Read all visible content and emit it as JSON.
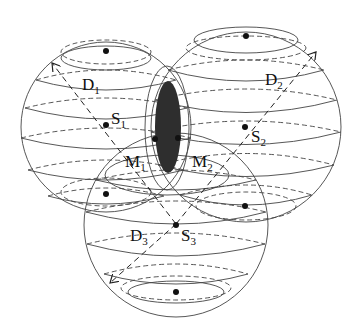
{
  "diagram": {
    "spheres": [
      {
        "id": "D1",
        "label": "D",
        "sub": "1",
        "center_label": "S",
        "center_sub": "1",
        "cx": 106,
        "cy": 127,
        "r": 85
      },
      {
        "id": "D2",
        "label": "D",
        "sub": "2",
        "center_label": "S",
        "center_sub": "2",
        "cx": 246,
        "cy": 127,
        "r": 95
      },
      {
        "id": "D3",
        "label": "D",
        "sub": "3",
        "center_label": "S",
        "center_sub": "3",
        "cx": 176,
        "cy": 225,
        "r": 92
      }
    ],
    "intersection_points": [
      {
        "label": "M",
        "sub": "1"
      },
      {
        "label": "M",
        "sub": "2"
      }
    ],
    "colors": {
      "stroke": "#333333",
      "fill_overlap": "#333333",
      "background": "#ffffff"
    }
  }
}
